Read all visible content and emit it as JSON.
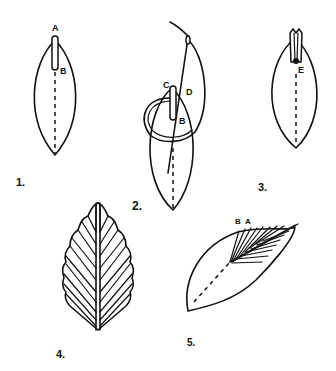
{
  "diagram": {
    "type": "instructional-illustration",
    "colors": {
      "ink": "#111111",
      "paper": "#ffffff"
    },
    "steps": [
      {
        "number": "1.",
        "point_labels": [
          "A",
          "B"
        ]
      },
      {
        "number": "2.",
        "point_labels": [
          "C",
          "D",
          "B"
        ]
      },
      {
        "number": "3.",
        "point_labels": [
          "E"
        ]
      },
      {
        "number": "4.",
        "point_labels": []
      },
      {
        "number": "5.",
        "point_labels": [
          "B",
          "A"
        ]
      }
    ]
  }
}
